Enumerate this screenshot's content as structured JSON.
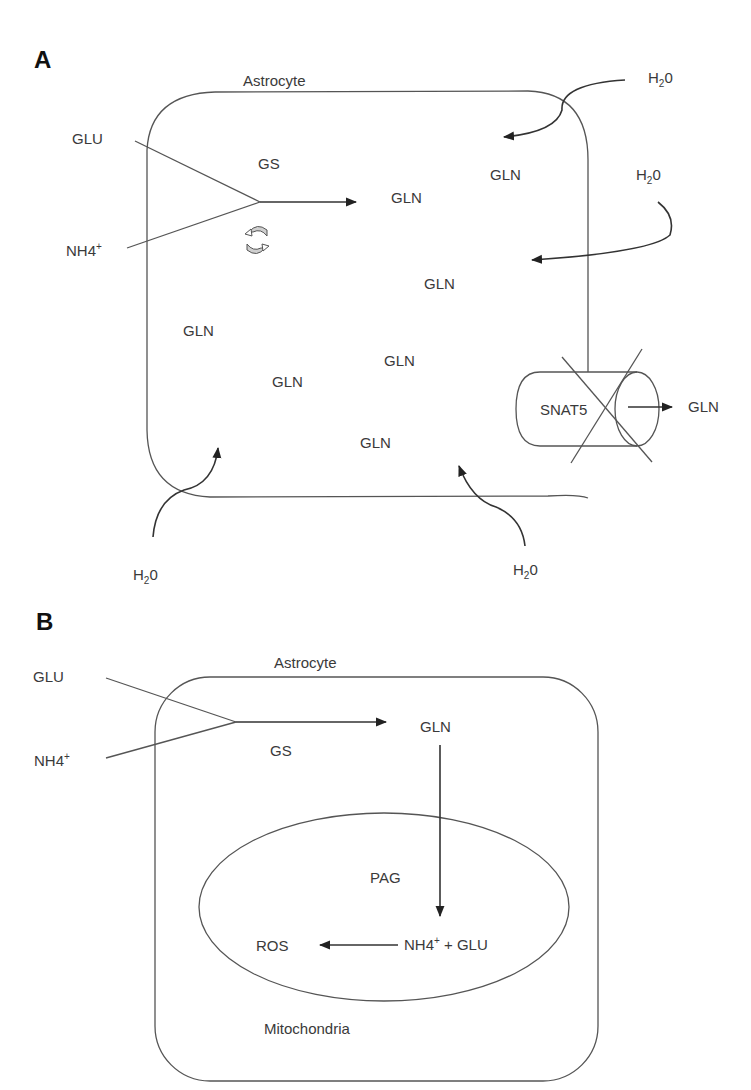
{
  "panel_a": {
    "panel_label": "A",
    "cell_label": "Astrocyte",
    "inputs": {
      "glu": "GLU",
      "nh4": "NH4",
      "nh4_charge": "+"
    },
    "enzyme": "GS",
    "product": "GLN",
    "cycle_icon": "recycle-arrows-icon",
    "gln_labels": [
      "GLN",
      "GLN",
      "GLN",
      "GLN",
      "GLN",
      "GLN",
      "GLN"
    ],
    "water": {
      "h": "H",
      "sub": "2",
      "o": "0"
    },
    "transporter": {
      "label": "SNAT5",
      "status": "blocked",
      "export_label": "GLN"
    }
  },
  "panel_b": {
    "panel_label": "B",
    "cell_label": "Astrocyte",
    "inputs": {
      "glu": "GLU",
      "nh4": "NH4",
      "nh4_charge": "+"
    },
    "enzyme": "GS",
    "product": "GLN",
    "organelle_label": "Mitochondria",
    "mito_enzyme": "PAG",
    "mito_products": {
      "nh4": "NH4",
      "nh4_charge": "+",
      "rest": " + GLU"
    },
    "output": "ROS"
  },
  "colors": {
    "line": "#555555",
    "arrow": "#333333",
    "text": "#3a3a3a",
    "background": "#ffffff"
  }
}
